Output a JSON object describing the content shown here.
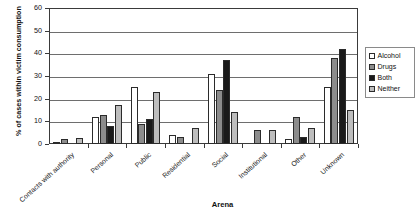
{
  "chart_data": {
    "type": "bar",
    "title": "",
    "xlabel": "Arena",
    "ylabel": "% of cases within victim consumption",
    "ylim": [
      0,
      60
    ],
    "yticks": [
      0,
      10,
      20,
      30,
      40,
      50,
      60
    ],
    "grid": true,
    "legend_position": "right",
    "categories": [
      "Contacts with authority",
      "Personal",
      "Public",
      "Residential",
      "Social",
      "Institutional",
      "Other",
      "Unknown"
    ],
    "series": [
      {
        "name": "Alcohol",
        "color": "#ffffff",
        "values": [
          0.5,
          12,
          25,
          4,
          31,
          0,
          2,
          25
        ]
      },
      {
        "name": "Drugs",
        "color": "#8c8c8c",
        "values": [
          2,
          13,
          9,
          3,
          24,
          6,
          12,
          38
        ]
      },
      {
        "name": "Both",
        "color": "#1a1a1a",
        "values": [
          0,
          8,
          11,
          0,
          37,
          0,
          3,
          42
        ]
      },
      {
        "name": "Neither",
        "color": "#bdbdbd",
        "values": [
          2.5,
          17,
          23,
          7,
          14,
          6,
          7,
          15
        ]
      }
    ]
  }
}
